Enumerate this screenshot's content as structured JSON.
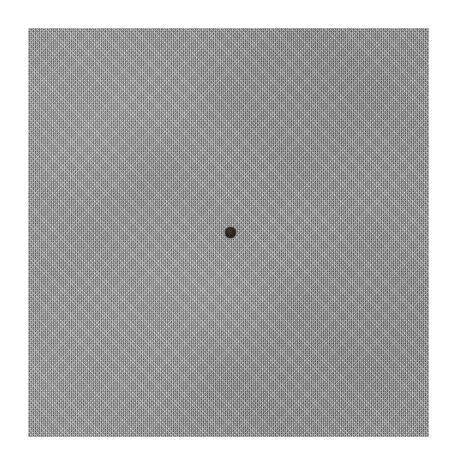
{
  "canvas": {
    "width": 452,
    "height": 464,
    "background_color": "#ffffff",
    "description": "Scanned photographic plate: a flat halftone-textured gray square on a white page, with one small dark dot near the center."
  },
  "gray_field": {
    "name": "gray-textured-square",
    "fill_color": "#9d9d9d",
    "texture": "fine halftone screen grain",
    "left": 28,
    "top": 28,
    "width": 401,
    "height": 409
  },
  "center_dot": {
    "name": "center-dot",
    "color": "#2f2420",
    "center_x": 230,
    "center_y": 232,
    "diameter": 11,
    "shape": "circle"
  }
}
